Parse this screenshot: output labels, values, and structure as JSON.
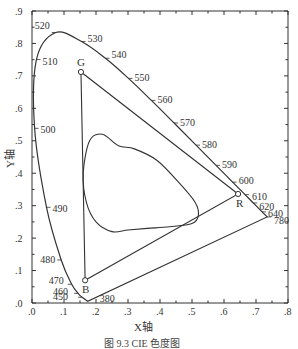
{
  "figure": {
    "caption": "图 9.3   CIE 色度图",
    "x_axis_title": "X轴",
    "y_axis_title": "Y轴"
  },
  "chart_data": {
    "type": "scatter",
    "title": "CIE 色度图",
    "xlabel": "X轴",
    "ylabel": "Y轴",
    "xlim": [
      0,
      0.8
    ],
    "ylim": [
      0,
      0.9
    ],
    "x_ticks": [
      ".0",
      ".1",
      ".2",
      ".3",
      ".4",
      ".5",
      ".6",
      ".7",
      ".8"
    ],
    "y_ticks": [
      ".0",
      ".1",
      ".2",
      ".3",
      ".4",
      ".5",
      ".6",
      ".7",
      ".8",
      ".9"
    ],
    "grid": false,
    "spectral_locus": [
      {
        "nm": 380,
        "x": 0.1741,
        "y": 0.005,
        "label": "380"
      },
      {
        "nm": 450,
        "x": 0.1566,
        "y": 0.0177,
        "label": "450"
      },
      {
        "nm": 460,
        "x": 0.144,
        "y": 0.0297,
        "label": "460"
      },
      {
        "nm": 470,
        "x": 0.1241,
        "y": 0.0578,
        "label": "470"
      },
      {
        "nm": 480,
        "x": 0.0913,
        "y": 0.1327,
        "label": "480"
      },
      {
        "nm": 490,
        "x": 0.0454,
        "y": 0.295,
        "label": "490"
      },
      {
        "nm": 500,
        "x": 0.0082,
        "y": 0.5384,
        "label": "500"
      },
      {
        "nm": 510,
        "x": 0.0139,
        "y": 0.7502,
        "label": "510"
      },
      {
        "nm": 520,
        "x": 0.0743,
        "y": 0.8338,
        "label": "520"
      },
      {
        "nm": 530,
        "x": 0.1547,
        "y": 0.8059,
        "label": "530"
      },
      {
        "nm": 540,
        "x": 0.2296,
        "y": 0.7543,
        "label": "540"
      },
      {
        "nm": 550,
        "x": 0.3016,
        "y": 0.6923,
        "label": "550"
      },
      {
        "nm": 560,
        "x": 0.3731,
        "y": 0.6245,
        "label": "560"
      },
      {
        "nm": 570,
        "x": 0.4441,
        "y": 0.5547,
        "label": "570"
      },
      {
        "nm": 580,
        "x": 0.5125,
        "y": 0.4866,
        "label": "580"
      },
      {
        "nm": 590,
        "x": 0.5752,
        "y": 0.4242,
        "label": "590"
      },
      {
        "nm": 600,
        "x": 0.627,
        "y": 0.3725,
        "label": "600"
      },
      {
        "nm": 610,
        "x": 0.6658,
        "y": 0.334,
        "label": "610"
      },
      {
        "nm": 620,
        "x": 0.6915,
        "y": 0.3083,
        "label": "620"
      },
      {
        "nm": 640,
        "x": 0.719,
        "y": 0.2809,
        "label": "640"
      },
      {
        "nm": 780,
        "x": 0.7347,
        "y": 0.2653,
        "label": "780"
      }
    ],
    "gamut_triangle": {
      "R": {
        "x": 0.644,
        "y": 0.336,
        "label": "R"
      },
      "G": {
        "x": 0.153,
        "y": 0.712,
        "label": "G"
      },
      "B": {
        "x": 0.166,
        "y": 0.07,
        "label": "B"
      }
    },
    "inner_gamut_label": "",
    "inner_gamut_outline": [
      [
        0.16,
        0.4
      ],
      [
        0.18,
        0.5
      ],
      [
        0.22,
        0.52
      ],
      [
        0.27,
        0.485
      ],
      [
        0.32,
        0.475
      ],
      [
        0.39,
        0.44
      ],
      [
        0.46,
        0.37
      ],
      [
        0.51,
        0.31
      ],
      [
        0.52,
        0.27
      ],
      [
        0.5,
        0.245
      ],
      [
        0.43,
        0.235
      ],
      [
        0.36,
        0.23
      ],
      [
        0.3,
        0.225
      ],
      [
        0.25,
        0.22
      ],
      [
        0.2,
        0.25
      ],
      [
        0.17,
        0.31
      ],
      [
        0.16,
        0.4
      ]
    ]
  }
}
